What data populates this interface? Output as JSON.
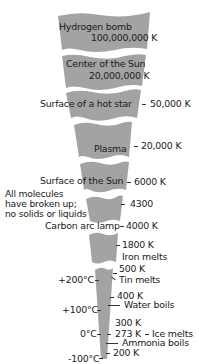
{
  "diagram": {
    "band_color": "#a3a3a3",
    "gap_color": "#ffffff",
    "segments": [
      {
        "label": "Hydrogen bomb",
        "value": "100,000,000 K"
      },
      {
        "label": "Center of the Sun",
        "value": "20,000,000 K"
      },
      {
        "label": "Surface of a hot star",
        "value": "50,000 K"
      },
      {
        "label": "Plasma",
        "value": "20,000 K"
      },
      {
        "label": "Surface of the Sun",
        "value": "6000 K"
      },
      {
        "label": "Carbon arc lamp",
        "value": "4000 K"
      },
      {
        "label": "Iron melts",
        "value": "1800 K"
      }
    ],
    "note": {
      "line1": "All molecules",
      "line2": "have broken up;",
      "line3": "no solids or liquids",
      "value": "4300"
    },
    "kelvin_marks": {
      "k500": "500 K",
      "k400": "400 K",
      "k300": "300 K",
      "k273": "273 K",
      "k200": "200 K"
    },
    "events": {
      "tin": "Tin melts",
      "water": "Water boils",
      "ice": "Ice melts",
      "ammonia": "Ammonia boils"
    },
    "celsius_marks": {
      "c200": "+200°C",
      "c100": "+100°C",
      "c0": "0°C",
      "cm100": "-100°C"
    }
  }
}
